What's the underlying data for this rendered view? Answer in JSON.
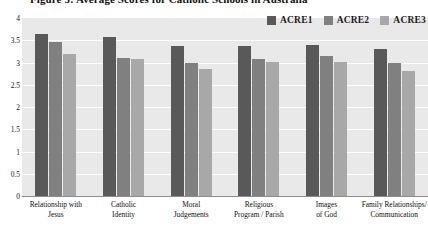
{
  "figure": {
    "caption": "Figure 5: Average Scores for Catholic Schools in Australia"
  },
  "legend": {
    "position": "top-right",
    "items": [
      {
        "label": "ACRE1",
        "color": "#595959",
        "name": "legend-acre1"
      },
      {
        "label": "ACRE2",
        "color": "#808080",
        "name": "legend-acre2"
      },
      {
        "label": "ACRE3",
        "color": "#a8a8a8",
        "name": "legend-acre3"
      }
    ]
  },
  "chart_data": {
    "type": "bar",
    "title": "Figure 5: Average Scores for Catholic Schools in Australia",
    "xlabel": "",
    "ylabel": "",
    "ylim": [
      0,
      4
    ],
    "ytick_step": 0.5,
    "yticks": [
      "4",
      "3.5",
      "3",
      "2.5",
      "2",
      "1.5",
      "1",
      "0.5",
      "0"
    ],
    "grid": true,
    "grid_axis": "y",
    "plot_background": "#e9e9e9",
    "categories": [
      "Relationship with Jesus",
      "Catholic Identity",
      "Moral Judgements",
      "Religious Program / Parish",
      "Images of God",
      "Family Relationships/ Communication"
    ],
    "categories_lines": [
      [
        "Relationship with",
        "Jesus"
      ],
      [
        "Catholic",
        "Identity"
      ],
      [
        "Moral",
        "Judgements"
      ],
      [
        "Religious",
        "Program / Parish"
      ],
      [
        "Images",
        "of God"
      ],
      [
        "Family Relationships/",
        "Communication"
      ]
    ],
    "series": [
      {
        "name": "ACRE1",
        "color": "#595959",
        "values": [
          3.65,
          3.57,
          3.38,
          3.38,
          3.4,
          3.3
        ]
      },
      {
        "name": "ACRE2",
        "color": "#808080",
        "values": [
          3.45,
          3.1,
          3.0,
          3.08,
          3.15,
          2.98
        ]
      },
      {
        "name": "ACRE3",
        "color": "#a8a8a8",
        "values": [
          3.2,
          3.07,
          2.85,
          3.02,
          3.02,
          2.8
        ]
      }
    ]
  }
}
